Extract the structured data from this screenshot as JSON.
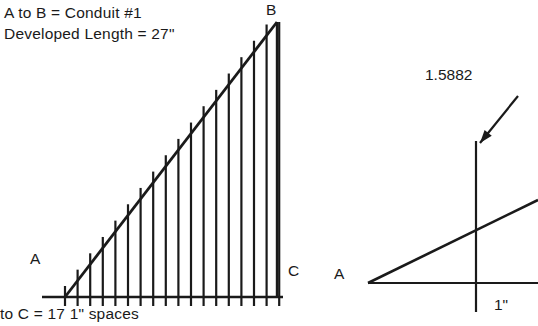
{
  "figure": {
    "type": "technical-drawing",
    "background_color": "#ffffff",
    "ink_color": "#1a1a1a"
  },
  "notes": {
    "line1": "A  to  B  =  Conduit #1",
    "line2": "Developed Length  =  27\""
  },
  "caption": {
    "line1": "to  C  =  17   1\" spaces"
  },
  "left_diagram": {
    "name": "developed-length-triangle",
    "vertex_labels": {
      "a": "A",
      "b": "B",
      "c": "C"
    },
    "geometry": {
      "a_x": 65,
      "a_y": 297,
      "b_x": 277,
      "b_y": 22,
      "c_x": 277,
      "c_y": 297,
      "baseline_start_x": 42,
      "baseline_end_x": 283,
      "tick_count": 18,
      "tick_spacing": 12.6,
      "tick_below": 9,
      "ordinate_overshoot": 11
    }
  },
  "right_diagram": {
    "name": "ordinate-detail",
    "vertex_label": "A",
    "value_label": "1.5882",
    "span_label": "1\"",
    "geometry": {
      "a_x": 368,
      "baseline_y": 283,
      "baseline_end_x": 538,
      "ordinate_x": 476,
      "ordinate_top_y": 141,
      "ordinate_bottom_y": 312,
      "hyp_end_x": 538,
      "hyp_end_y": 200,
      "leader_from_x": 518,
      "leader_from_y": 96,
      "leader_to_x": 480,
      "leader_to_y": 143
    }
  }
}
